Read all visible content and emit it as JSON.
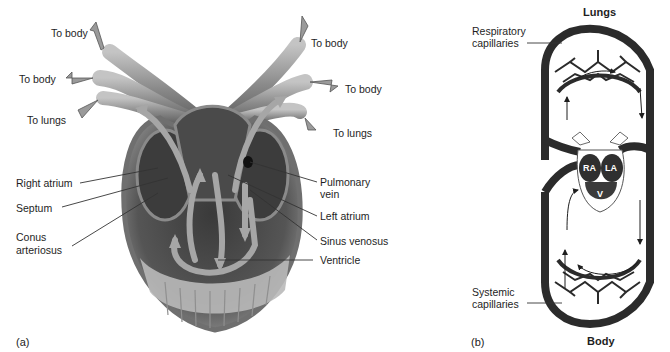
{
  "figure": {
    "panel_a": {
      "tag": "(a)",
      "labels": {
        "to_body_top_left": "To body",
        "to_body_mid_left": "To body",
        "to_lungs_left": "To lungs",
        "to_body_top_right": "To body",
        "to_body_mid_right": "To body",
        "to_lungs_right": "To lungs",
        "right_atrium": "Right atrium",
        "septum": "Septum",
        "conus_arteriosus_line1": "Conus",
        "conus_arteriosus_line2": "arteriosus",
        "pulmonary_vein_line1": "Pulmonary",
        "pulmonary_vein_line2": "vein",
        "left_atrium": "Left atrium",
        "sinus_venosus": "Sinus venosus",
        "ventricle": "Ventricle"
      }
    },
    "panel_b": {
      "tag": "(b)",
      "labels": {
        "lungs": "Lungs",
        "body": "Body",
        "respiratory_capillaries_line1": "Respiratory",
        "respiratory_capillaries_line2": "capillaries",
        "systemic_capillaries_line1": "Systemic",
        "systemic_capillaries_line2": "capillaries",
        "ra": "RA",
        "la": "LA",
        "v": "V"
      }
    },
    "colors": {
      "vessel_dark": "#2b2b2b",
      "heart_mid": "#6e6e6e",
      "heart_light": "#a8a8a8",
      "arrow_fill": "#9a9a9a",
      "leader_line": "#333333"
    }
  }
}
